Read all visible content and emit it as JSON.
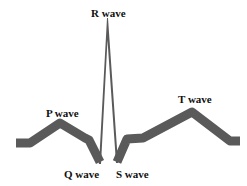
{
  "diagram": {
    "colors": {
      "trace": "#595959",
      "label": "#111111",
      "background": "#ffffff"
    },
    "labels": {
      "r_wave": "R wave",
      "p_wave": "P wave",
      "t_wave": "T wave",
      "q_wave": "Q wave",
      "s_wave": "S wave"
    }
  }
}
